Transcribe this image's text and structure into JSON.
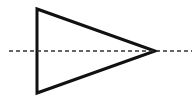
{
  "diagram": {
    "type": "geometric-figure",
    "triangle": {
      "vertices": [
        [
          37,
          9
        ],
        [
          37,
          93
        ],
        [
          155,
          51
        ]
      ],
      "stroke": "#111111",
      "stroke_width": 3,
      "fill": "#ffffff"
    },
    "axis": {
      "x1": 9,
      "y1": 51,
      "x2": 192,
      "y2": 51,
      "stroke": "#333333",
      "stroke_width": 1.5,
      "dash": "4 3"
    },
    "background": "#ffffff"
  }
}
